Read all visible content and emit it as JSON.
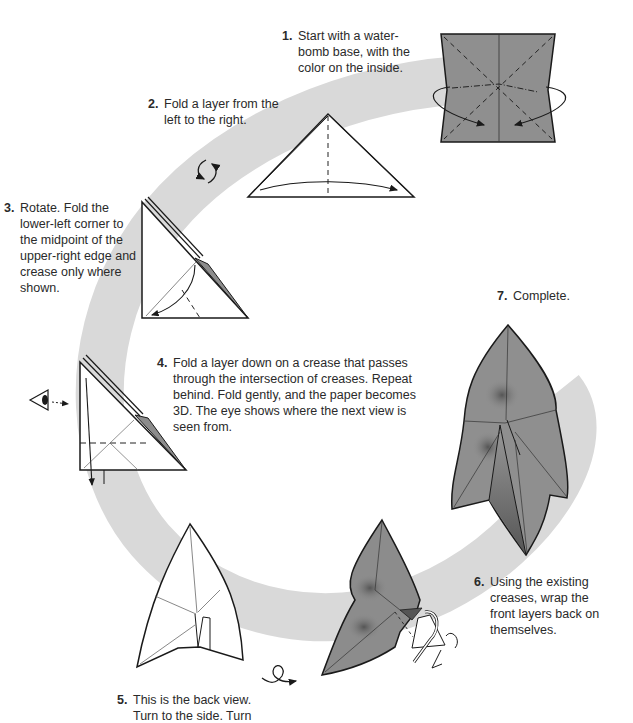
{
  "diagram": {
    "colors": {
      "band": "#d9d9d9",
      "paper_colored": "#8c8c8c",
      "paper_white": "#ffffff",
      "line": "#1a1a1a"
    },
    "steps": [
      {
        "number": "1.",
        "text": "Start with a water-bomb base, with the color on the inside."
      },
      {
        "number": "2.",
        "text": "Fold a layer from the left to the right."
      },
      {
        "number": "3.",
        "text": "Rotate. Fold the lower-left corner to the midpoint of the upper-right edge and crease only where shown."
      },
      {
        "number": "4.",
        "text": "Fold a layer down on a crease that passes through the intersection of creases. Repeat behind. Fold gently, and the paper becomes 3D. The eye shows where the next view is seen from."
      },
      {
        "number": "5.",
        "text": "This is the back view. Turn to the side. Turn"
      },
      {
        "number": "6.",
        "text": "Using the existing creases, wrap the front layers back on themselves."
      },
      {
        "number": "7.",
        "text": "Complete."
      }
    ]
  }
}
